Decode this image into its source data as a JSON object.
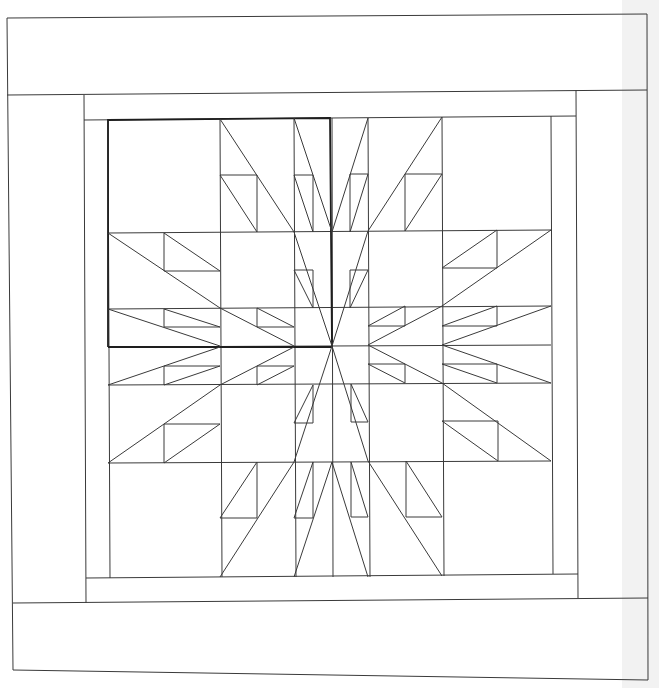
{
  "diagram": {
    "type": "quilt-pattern-line-drawing",
    "colors": {
      "background": "#ffffff",
      "page_margin": "#f2f2f2",
      "line": "#3a3a3a",
      "highlight_line": "#1e1e1e"
    },
    "border": {
      "outer": [
        [
          7,
          18
        ],
        [
          647,
          14
        ],
        [
          648,
          680
        ],
        [
          13,
          670
        ]
      ],
      "top_band_bottom": [
        [
          7,
          95
        ],
        [
          647,
          90
        ]
      ],
      "bottom_band_top": [
        [
          13,
          603
        ],
        [
          648,
          598
        ]
      ],
      "left_column_inner_x": 84,
      "right_column_inner_x": 578,
      "inner_sashing": {
        "x0": 84,
        "y0": 95,
        "x1": 578,
        "y1": 603
      },
      "inner_frame": {
        "x0": 108,
        "y0": 118,
        "x1": 551,
        "y1": 577
      }
    },
    "grid": {
      "columns_x": [
        108,
        220,
        294,
        332,
        368,
        442,
        551
      ],
      "rows_y": [
        118,
        232,
        308,
        346,
        384,
        462,
        577
      ]
    },
    "highlight_block": {
      "x0": 108,
      "y0": 118,
      "x1": 332,
      "y1": 346
    },
    "center": [
      332,
      346
    ],
    "star_points": 32,
    "block_count": 4
  }
}
